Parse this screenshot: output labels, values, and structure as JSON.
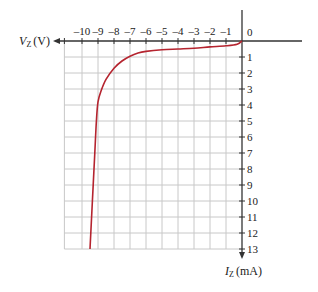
{
  "chart_data": {
    "type": "line",
    "title": "",
    "xlabel": "V_Z (V)",
    "xlabel_main": "V",
    "xlabel_sub": "Z",
    "xlabel_unit": "(V)",
    "ylabel": "I_Z (mA)",
    "ylabel_main": "I",
    "ylabel_sub": "Z",
    "ylabel_unit": "(mA)",
    "x_ticks": [
      -10,
      -9,
      -8,
      -7,
      -6,
      -5,
      -4,
      -3,
      -2,
      -1
    ],
    "x_tick_labels": [
      "–10",
      "–9",
      "–8",
      "–7",
      "–6",
      "–5",
      "–4",
      "–3",
      "–2",
      "–1"
    ],
    "origin_label": "0",
    "y_ticks": [
      1,
      2,
      3,
      4,
      5,
      6,
      7,
      8,
      9,
      10,
      11,
      12,
      13
    ],
    "y_tick_labels": [
      "1",
      "2",
      "3",
      "4",
      "5",
      "6",
      "7",
      "8",
      "9",
      "10",
      "11",
      "12",
      "13"
    ],
    "xlim": [
      -11.1,
      0
    ],
    "ylim": [
      0,
      13
    ],
    "y_direction": "downward (increasing current plotted downward)",
    "grid": true,
    "series": [
      {
        "name": "Zener reverse characteristic",
        "color": "#b5242f",
        "points": [
          [
            0,
            0
          ],
          [
            -0.3,
            0.2
          ],
          [
            -1,
            0.3
          ],
          [
            -2,
            0.37
          ],
          [
            -3,
            0.45
          ],
          [
            -4,
            0.5
          ],
          [
            -5,
            0.55
          ],
          [
            -6,
            0.65
          ],
          [
            -6.5,
            0.75
          ],
          [
            -7,
            0.95
          ],
          [
            -7.5,
            1.25
          ],
          [
            -8,
            1.7
          ],
          [
            -8.5,
            2.4
          ],
          [
            -8.8,
            3.1
          ],
          [
            -9.0,
            3.8
          ],
          [
            -9.1,
            5
          ],
          [
            -9.2,
            7
          ],
          [
            -9.35,
            10
          ],
          [
            -9.5,
            13
          ]
        ]
      }
    ]
  },
  "colors": {
    "grid": "#c8c8c8",
    "axis": "#333333",
    "curve": "#b5242f",
    "text": "#222222"
  }
}
